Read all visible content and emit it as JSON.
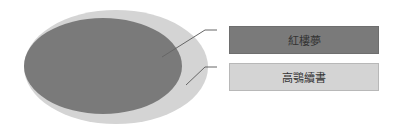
{
  "diagram": {
    "type": "nested-ellipse",
    "colors": {
      "outer": "#d4d4d4",
      "inner": "#7a7a7a",
      "leader": "#666666"
    },
    "items": [
      {
        "label": "紅樓夢",
        "role": "inner"
      },
      {
        "label": "高鶚續書",
        "role": "outer"
      }
    ]
  }
}
